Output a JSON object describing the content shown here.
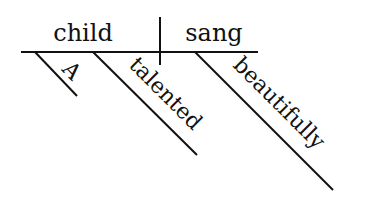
{
  "diagram": {
    "type": "sentence-diagram",
    "subject": "child",
    "predicate": "sang",
    "modifiers": {
      "subject": [
        "A",
        "talented"
      ],
      "predicate": [
        "beautifully"
      ]
    }
  },
  "colors": {
    "ink": "#111111",
    "background": "#ffffff"
  }
}
